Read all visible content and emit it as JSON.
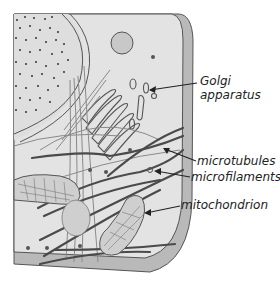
{
  "diagram": {
    "colors": {
      "cytoplasm": "#e4e4e4",
      "membrane": "#b8b8b8",
      "outline": "#555555",
      "microtubule": "#4a4a4a",
      "microfilament": "#8a8a8a",
      "nucleus_dots": "#333333",
      "organelle_fill": "#c8c8c8"
    },
    "labels": [
      {
        "id": "golgi",
        "lines": [
          "Golgi",
          "apparatus"
        ]
      },
      {
        "id": "microtubules",
        "lines": [
          "microtubules"
        ]
      },
      {
        "id": "microfilaments",
        "lines": [
          "microfilaments"
        ]
      },
      {
        "id": "mitochondrion",
        "lines": [
          "mitochondrion"
        ]
      }
    ]
  }
}
